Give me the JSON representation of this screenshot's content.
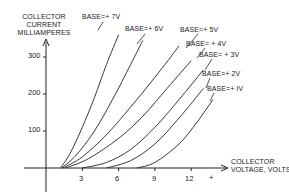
{
  "chart_data": {
    "type": "line",
    "title": "",
    "xlabel": "COLLECTOR VOLTAGE, VOLTS",
    "xlabel_sign": "+",
    "ylabel": "COLLECTOR CURRENT MILLIAMPERES",
    "ylabel_lines": [
      "COLLECTOR",
      "CURRENT",
      "MILLIAMPERES"
    ],
    "xlabel_lines": [
      "COLLECTOR",
      "VOLTAGE, VOLTS"
    ],
    "x_ticks": [
      3,
      6,
      9,
      12
    ],
    "y_ticks": [
      100,
      200,
      300
    ],
    "xlim": [
      -1.5,
      15
    ],
    "ylim": [
      -75,
      350
    ],
    "grid": false,
    "legend": "inline labels at top of each curve",
    "series": [
      {
        "name": "BASE=+7V",
        "label": "BASE=+ 7V",
        "x": [
          1.2,
          2,
          3,
          4,
          5,
          6
        ],
        "y": [
          0,
          40,
          110,
          190,
          280,
          360
        ]
      },
      {
        "name": "BASE=+6V",
        "label": "BASE=+ 6V",
        "x": [
          1.3,
          2.5,
          4,
          5.5,
          7,
          8
        ],
        "y": [
          0,
          35,
          100,
          185,
          280,
          345
        ]
      },
      {
        "name": "BASE=+5V",
        "label": "BASE=+ 5V",
        "x": [
          1.4,
          3,
          5,
          7,
          9,
          11
        ],
        "y": [
          0,
          30,
          90,
          165,
          245,
          330
        ]
      },
      {
        "name": "BASE=+4V",
        "label": "BASE= + 4V",
        "x": [
          1.6,
          3.5,
          6,
          8,
          10,
          12
        ],
        "y": [
          0,
          25,
          80,
          140,
          215,
          290
        ]
      },
      {
        "name": "BASE=+3V",
        "label": "BASE= + 3V",
        "x": [
          3,
          5,
          7,
          9,
          11,
          13
        ],
        "y": [
          0,
          15,
          50,
          110,
          185,
          265
        ]
      },
      {
        "name": "BASE=+2V",
        "label": "BASE=+ 2V",
        "x": [
          5,
          7,
          9,
          11,
          13
        ],
        "y": [
          0,
          20,
          65,
          135,
          215
        ]
      },
      {
        "name": "BASE=+1V",
        "label": "BASE=+ IV",
        "x": [
          7.5,
          9,
          11,
          12.5,
          13.8
        ],
        "y": [
          0,
          15,
          65,
          125,
          185
        ]
      }
    ]
  }
}
